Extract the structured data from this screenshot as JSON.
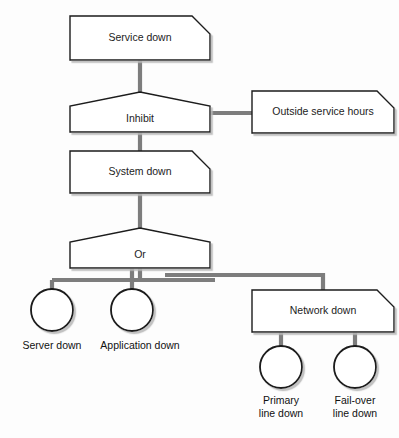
{
  "diagram": {
    "type": "fault-tree",
    "background_color": "#fdfdfd",
    "shape_fill": "#ffffff",
    "shape_border_color": "#1a1a1a",
    "connector_color": "#7d7d7d",
    "text_color": "#1c1c1c"
  },
  "nodes": {
    "service_down": {
      "label": "Service down",
      "shape": "chamfered-box",
      "x": 70,
      "y": 16,
      "w": 140,
      "h": 44,
      "chamfer": 18
    },
    "inhibit": {
      "label": "Inhibit",
      "shape": "house-gate",
      "x": 70,
      "y": 92,
      "w": 140,
      "h": 40,
      "peak": 14
    },
    "outside_service_hours": {
      "label": "Outside service hours",
      "shape": "chamfered-box",
      "x": 252,
      "y": 91,
      "w": 142,
      "h": 42,
      "chamfer": 17
    },
    "system_down": {
      "label": "System down",
      "shape": "chamfered-box",
      "x": 70,
      "y": 151,
      "w": 140,
      "h": 42,
      "chamfer": 18
    },
    "or_gate": {
      "label": "Or",
      "shape": "house-gate",
      "x": 70,
      "y": 228,
      "w": 140,
      "h": 40,
      "peak": 14
    },
    "network_down": {
      "label": "Network down",
      "shape": "chamfered-box",
      "x": 252,
      "y": 290,
      "w": 142,
      "h": 42,
      "chamfer": 17
    }
  },
  "events": [
    {
      "id": "server_down",
      "label_lines": [
        "Server down"
      ],
      "shape": "circle",
      "cx": 52,
      "cy": 310,
      "r": 21,
      "label_x": 52,
      "label_y": 349
    },
    {
      "id": "application_down",
      "label_lines": [
        "Application down"
      ],
      "shape": "circle",
      "cx": 132,
      "cy": 310,
      "r": 21,
      "label_x": 140,
      "label_y": 349
    },
    {
      "id": "primary_line_down",
      "label_lines": [
        "Primary",
        "line down"
      ],
      "shape": "circle",
      "cx": 281,
      "cy": 367,
      "r": 21,
      "label_x": 281,
      "label_y": 404
    },
    {
      "id": "failover_line_down",
      "label_lines": [
        "Fail-over",
        "line down"
      ],
      "shape": "circle",
      "cx": 355,
      "cy": 367,
      "r": 21,
      "label_x": 355,
      "label_y": 404
    }
  ],
  "connectors": [
    {
      "id": "service-to-inhibit",
      "d": "M 140 60 L 140 92"
    },
    {
      "id": "inhibit-to-outside",
      "d": "M 208 113 L 252 113"
    },
    {
      "id": "inhibit-to-system",
      "d": "M 140 132 L 140 151"
    },
    {
      "id": "system-to-or",
      "d": "M 140 193 L 140 228"
    },
    {
      "id": "or-bus-left",
      "d": "M 140 268 L 140 280 M 52 280 L 215 280 M 52 280 L 52 289"
    },
    {
      "id": "or-to-application",
      "d": "M 132 268 L 132 289"
    },
    {
      "id": "or-bus-right",
      "d": "M 165 275 L 323 275 L 323 290"
    },
    {
      "id": "network-to-primary",
      "d": "M 281 332 L 281 346"
    },
    {
      "id": "network-to-failover",
      "d": "M 355 332 L 355 346"
    }
  ]
}
